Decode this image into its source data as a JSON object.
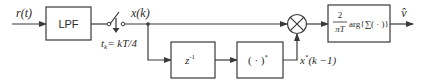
{
  "diagram": {
    "type": "block-diagram",
    "colors": {
      "stroke": "#3a3a3a",
      "text": "#2a2a2a",
      "background": "#ffffff"
    },
    "input": {
      "label": "r(t)"
    },
    "blocks": [
      {
        "id": "lpf",
        "label": "LPF"
      },
      {
        "id": "delay",
        "label": "z",
        "superscript": "-1"
      },
      {
        "id": "conj",
        "label": "( · )",
        "superscript": "*"
      },
      {
        "id": "estimator",
        "numerator": "2",
        "denominator": "πT",
        "label": "arg{∑( · )}"
      }
    ],
    "sampler": {
      "label": "t",
      "subscript": "k",
      "equation": "= kT/4"
    },
    "signals": {
      "sampled": "x(k)",
      "conjugate_delayed": {
        "base": "x",
        "superscript": "*",
        "arg": "(k −1)"
      },
      "output": "v̂"
    },
    "multiplier": {
      "symbol": "⊗"
    }
  }
}
